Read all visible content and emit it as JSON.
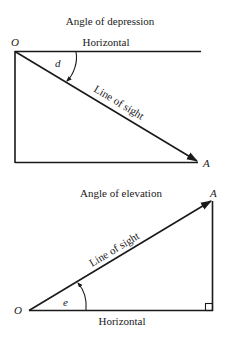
{
  "diagrams": {
    "depression": {
      "title": "Angle of depression",
      "observer_label": "O",
      "target_label": "A",
      "horizontal_label": "Horizontal",
      "line_of_sight_label": "Line of sight",
      "angle_label": "d"
    },
    "elevation": {
      "title": "Angle of elevation",
      "observer_label": "O",
      "target_label": "A",
      "horizontal_label": "Horizontal",
      "line_of_sight_label": "Line of sight",
      "angle_label": "e"
    }
  },
  "colors": {
    "ink": "#1a1a1a",
    "background": "#ffffff"
  }
}
